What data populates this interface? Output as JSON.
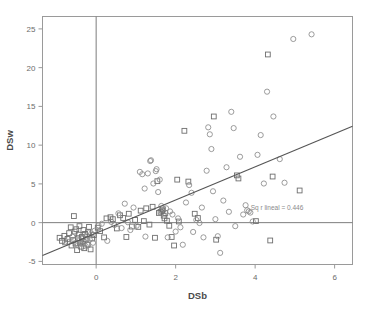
{
  "chart_data": {
    "type": "scatter",
    "title": "",
    "xlabel": "DSb",
    "ylabel": "DSw",
    "xlim": [
      -1.35,
      6.45
    ],
    "ylim": [
      -5.4,
      26.6
    ],
    "xticks": [
      0,
      2,
      4,
      6
    ],
    "xtick_labels": [
      "0",
      "2",
      "4",
      "6"
    ],
    "yticks": [
      -5,
      0,
      5,
      10,
      15,
      20,
      25
    ],
    "ytick_labels": [
      "-5",
      "0",
      "5",
      "10",
      "15",
      "20",
      "25"
    ],
    "grid": false,
    "legend": "none",
    "annotations": [
      {
        "text": "Sq r lineal = 0.446",
        "x": 4.55,
        "y": 1.65
      }
    ],
    "reference_lines": [
      {
        "name": "zero-horizontal",
        "orientation": "horizontal",
        "y": 0
      },
      {
        "name": "zero-vertical",
        "orientation": "vertical",
        "x": 0
      }
    ],
    "fit_line": {
      "name": "linear-fit",
      "x_start": -1.35,
      "y_start": -4.25,
      "x_end": 6.45,
      "y_end": 12.45,
      "r_squared": 0.446
    },
    "series": [
      {
        "name": "squares",
        "marker": "square",
        "color": "#6e6e6e",
        "points": [
          [
            -0.92,
            -1.95
          ],
          [
            -0.86,
            -2.35
          ],
          [
            -0.8,
            -1.7
          ],
          [
            -0.78,
            -2.55
          ],
          [
            -0.72,
            -2.1
          ],
          [
            -0.68,
            -1.35
          ],
          [
            -0.64,
            -0.6
          ],
          [
            -0.62,
            -2.95
          ],
          [
            -0.58,
            -2.25
          ],
          [
            -0.56,
            0.85
          ],
          [
            -0.54,
            -1.15
          ],
          [
            -0.52,
            -2.7
          ],
          [
            -0.5,
            -0.85
          ],
          [
            -0.48,
            -3.55
          ],
          [
            -0.46,
            -2.0
          ],
          [
            -0.44,
            -1.55
          ],
          [
            -0.42,
            -0.45
          ],
          [
            -0.4,
            -2.6
          ],
          [
            -0.38,
            -3.1
          ],
          [
            -0.36,
            -1.85
          ],
          [
            -0.34,
            -2.4
          ],
          [
            -0.32,
            -0.95
          ],
          [
            -0.3,
            -3.3
          ],
          [
            -0.28,
            -1.45
          ],
          [
            -0.26,
            -2.15
          ],
          [
            -0.22,
            -2.85
          ],
          [
            -0.2,
            -1.25
          ],
          [
            -0.18,
            -0.55
          ],
          [
            -0.14,
            -3.45
          ],
          [
            -0.1,
            -2.05
          ],
          [
            -0.06,
            -1.6
          ],
          [
            0.04,
            -0.65
          ],
          [
            0.1,
            -1.1
          ],
          [
            0.2,
            -1.9
          ],
          [
            0.26,
            0.55
          ],
          [
            0.36,
            0.7
          ],
          [
            0.42,
            0.45
          ],
          [
            0.52,
            -0.75
          ],
          [
            0.6,
            0.95
          ],
          [
            0.68,
            0.6
          ],
          [
            0.76,
            -1.85
          ],
          [
            0.82,
            1.15
          ],
          [
            0.9,
            -0.5
          ],
          [
            0.98,
            0.35
          ],
          [
            1.06,
            -0.55
          ],
          [
            1.12,
            1.55
          ],
          [
            1.2,
            0.2
          ],
          [
            1.26,
            1.85
          ],
          [
            1.34,
            -0.25
          ],
          [
            1.42,
            2.05
          ],
          [
            1.48,
            -1.95
          ],
          [
            1.54,
            5.35
          ],
          [
            1.58,
            1.25
          ],
          [
            1.62,
            1.4
          ],
          [
            1.66,
            1.55
          ],
          [
            1.68,
            1.7
          ],
          [
            1.7,
            0.9
          ],
          [
            1.72,
            0.55
          ],
          [
            1.74,
            1.25
          ],
          [
            1.78,
            0.25
          ],
          [
            1.84,
            -0.4
          ],
          [
            1.9,
            -1.85
          ],
          [
            1.96,
            -2.95
          ],
          [
            2.04,
            5.55
          ],
          [
            2.08,
            0.15
          ],
          [
            2.22,
            11.85
          ],
          [
            2.32,
            5.3
          ],
          [
            2.48,
            1.15
          ],
          [
            2.56,
            0.6
          ],
          [
            2.96,
            13.7
          ],
          [
            3.02,
            -2.2
          ],
          [
            3.54,
            6.1
          ],
          [
            3.58,
            5.7
          ],
          [
            4.02,
            0.2
          ],
          [
            4.32,
            21.7
          ],
          [
            4.38,
            -2.3
          ],
          [
            4.44,
            5.95
          ],
          [
            5.12,
            4.15
          ]
        ]
      },
      {
        "name": "circles",
        "marker": "circle",
        "color": "#8a8a8a",
        "points": [
          [
            -0.7,
            -2.5
          ],
          [
            -0.6,
            -1.8
          ],
          [
            -0.55,
            -2.25
          ],
          [
            -0.5,
            -2.6
          ],
          [
            -0.46,
            -2.9
          ],
          [
            -0.42,
            -2.3
          ],
          [
            -0.38,
            -2.7
          ],
          [
            -0.34,
            -1.95
          ],
          [
            -0.3,
            -2.45
          ],
          [
            -0.26,
            -3.05
          ],
          [
            -0.24,
            -1.65
          ],
          [
            -0.2,
            -2.85
          ],
          [
            -0.16,
            -2.2
          ],
          [
            -0.12,
            -1.4
          ],
          [
            -0.08,
            -2.6
          ],
          [
            -0.04,
            -1.05
          ],
          [
            0.06,
            -0.35
          ],
          [
            0.14,
            -0.15
          ],
          [
            0.28,
            -2.35
          ],
          [
            0.38,
            0.1
          ],
          [
            0.46,
            -0.3
          ],
          [
            0.56,
            1.2
          ],
          [
            0.64,
            -0.7
          ],
          [
            0.72,
            2.45
          ],
          [
            0.8,
            0.05
          ],
          [
            0.86,
            -0.95
          ],
          [
            0.94,
            1.95
          ],
          [
            1.02,
            -0.4
          ],
          [
            1.1,
            6.55
          ],
          [
            1.16,
            6.25
          ],
          [
            1.22,
            4.4
          ],
          [
            1.24,
            -1.8
          ],
          [
            1.3,
            6.35
          ],
          [
            1.36,
            7.95
          ],
          [
            1.38,
            8.05
          ],
          [
            1.44,
            5.05
          ],
          [
            1.5,
            6.65
          ],
          [
            1.52,
            6.9
          ],
          [
            1.56,
            3.95
          ],
          [
            1.6,
            5.55
          ],
          [
            1.64,
            2.15
          ],
          [
            1.76,
            1.85
          ],
          [
            1.8,
            -1.9
          ],
          [
            1.86,
            1.45
          ],
          [
            1.92,
            1.05
          ],
          [
            2.0,
            -1.15
          ],
          [
            2.06,
            0.55
          ],
          [
            2.12,
            -0.6
          ],
          [
            2.18,
            -2.85
          ],
          [
            2.26,
            2.6
          ],
          [
            2.34,
            4.85
          ],
          [
            2.4,
            3.85
          ],
          [
            2.44,
            -1.2
          ],
          [
            2.52,
            0.35
          ],
          [
            2.6,
            -0.05
          ],
          [
            2.66,
            1.95
          ],
          [
            2.7,
            -1.9
          ],
          [
            2.78,
            6.7
          ],
          [
            2.82,
            12.3
          ],
          [
            2.86,
            11.4
          ],
          [
            2.9,
            9.5
          ],
          [
            2.94,
            4.05
          ],
          [
            3.0,
            0.45
          ],
          [
            3.06,
            -1.75
          ],
          [
            3.12,
            -3.9
          ],
          [
            3.2,
            2.85
          ],
          [
            3.28,
            7.15
          ],
          [
            3.34,
            1.4
          ],
          [
            3.4,
            14.3
          ],
          [
            3.46,
            12.2
          ],
          [
            3.5,
            -0.45
          ],
          [
            3.62,
            8.5
          ],
          [
            3.7,
            1.05
          ],
          [
            3.76,
            2.25
          ],
          [
            3.8,
            1.6
          ],
          [
            3.84,
            1.45
          ],
          [
            3.88,
            1.3
          ],
          [
            3.94,
            0.15
          ],
          [
            4.06,
            8.75
          ],
          [
            4.14,
            11.3
          ],
          [
            4.22,
            5.05
          ],
          [
            4.3,
            16.9
          ],
          [
            4.46,
            13.7
          ],
          [
            4.62,
            8.2
          ],
          [
            4.74,
            5.15
          ],
          [
            4.96,
            23.7
          ],
          [
            5.42,
            24.3
          ]
        ]
      }
    ]
  },
  "axes": {
    "x_title": "DSb",
    "y_title": "DSw"
  }
}
